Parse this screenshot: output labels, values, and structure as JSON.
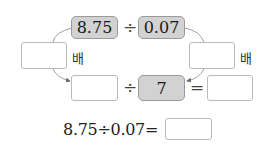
{
  "diagram": {
    "top_left_value": "8.75",
    "top_divide": "÷",
    "top_right_value": "0.07",
    "left_multiplier_input": "",
    "left_multiplier_unit": "배",
    "right_multiplier_input": "",
    "right_multiplier_unit": "배",
    "bottom_left_input": "",
    "bottom_divide": "÷",
    "bottom_divisor": "7",
    "bottom_equals": "=",
    "bottom_result_input": ""
  },
  "equation": {
    "text": "8.75÷0.07=",
    "answer_input": ""
  },
  "colors": {
    "filled_box": "#d2d2d2",
    "border": "#b9b9b9",
    "arrow": "#777777"
  }
}
